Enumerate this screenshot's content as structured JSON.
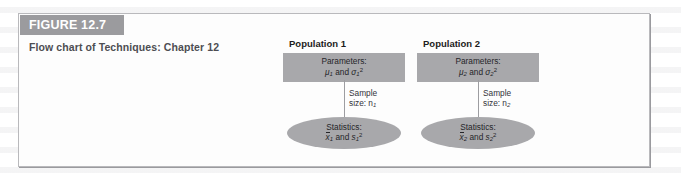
{
  "figure": {
    "banner_label": "FIGURE 12.7",
    "caption": "Flow chart of Techniques: Chapter 12",
    "banner_color": "#9b9b9e",
    "box_fill": "#a8a8ab",
    "border_color": "#b9b9bc"
  },
  "diagram": {
    "type": "flow-chart",
    "groups": [
      {
        "title": "Population 1",
        "parameters_line1": "Parameters:",
        "parameters_line2_mu": "μ",
        "parameters_line2_mu_sub": "1",
        "parameters_line2_and": " and ",
        "parameters_line2_sigma": "σ",
        "parameters_line2_sigma_sub": "1",
        "parameters_line2_sigma_sup": "2",
        "sample_line1": "Sample",
        "sample_line2": "size: n",
        "sample_line2_sub": "1",
        "statistics_line1": "Statistics:",
        "statistics_xbar": "x",
        "statistics_xbar_sub": "1",
        "statistics_and": " and ",
        "statistics_s": "s",
        "statistics_s_sub": "1",
        "statistics_s_sup": "2"
      },
      {
        "title": "Population 2",
        "parameters_line1": "Parameters:",
        "parameters_line2_mu": "μ",
        "parameters_line2_mu_sub": "2",
        "parameters_line2_and": " and ",
        "parameters_line2_sigma": "σ",
        "parameters_line2_sigma_sub": "2",
        "parameters_line2_sigma_sup": "2",
        "sample_line1": "Sample",
        "sample_line2": "size: n",
        "sample_line2_sub": "2",
        "statistics_line1": "Statistics:",
        "statistics_xbar": "x",
        "statistics_xbar_sub": "2",
        "statistics_and": " and ",
        "statistics_s": "s",
        "statistics_s_sub": "2",
        "statistics_s_sup": "2"
      }
    ]
  }
}
